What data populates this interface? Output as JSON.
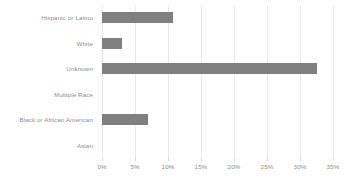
{
  "chart_data": {
    "type": "bar",
    "orientation": "horizontal",
    "title": "",
    "subtitle": "",
    "xlabel": "",
    "ylabel": "",
    "categories": [
      "Hispanic or Latino",
      "White",
      "Unknown",
      "Multiple Race",
      "Black or African American",
      "Asian"
    ],
    "values": [
      10.7,
      3.0,
      32.5,
      0,
      7.0,
      0
    ],
    "value_unit": "%",
    "xlim": [
      0,
      35
    ],
    "xticks": [
      0,
      5,
      10,
      15,
      20,
      25,
      30,
      35
    ],
    "xtick_labels": [
      "0%",
      "5%",
      "10%",
      "15%",
      "20%",
      "25%",
      "30%",
      "35%"
    ],
    "grid": "vertical",
    "legend": "none",
    "series": [
      {
        "name": "",
        "values": [
          10.7,
          3.0,
          32.5,
          0,
          7.0,
          0
        ]
      }
    ],
    "colors": {
      "bar_fill": "#808080",
      "gridline": "#e8e8e8",
      "axis_text": "#8c8c8c",
      "background": "#ffffff"
    }
  }
}
